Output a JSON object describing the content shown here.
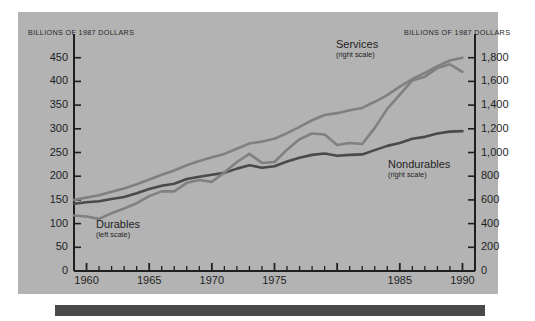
{
  "header": {
    "left_units": "BILLIONS OF 1987 DOLLARS",
    "right_units": "BILLIONS OF 1987 DOLLARS"
  },
  "colors": {
    "panel_background": "#b3b3b3",
    "page_background": "#ffffff",
    "axis": "#1f1f1f",
    "series_dark": "#4a4a4a",
    "series_light": "#808080",
    "footer_bar": "#4a4a4a",
    "text": "#1f1f1f"
  },
  "axes": {
    "left": {
      "ticks": [
        "0",
        "50",
        "100",
        "150",
        "200",
        "250",
        "300",
        "350",
        "400",
        "450"
      ],
      "min": 0,
      "max": 500,
      "label_top": "BILLIONS OF 1987 DOLLARS"
    },
    "right": {
      "ticks": [
        "0",
        "200",
        "400",
        "600",
        "800",
        "1,000",
        "1,200",
        "1,400",
        "1,600",
        "1,800"
      ],
      "min": 0,
      "max": 2000,
      "label_top": "BILLIONS OF 1987 DOLLARS"
    },
    "x": {
      "ticks": [
        "1960",
        "1965",
        "1970",
        "1975",
        "1985",
        "1990"
      ],
      "all_ticks": [
        "1960",
        "1965",
        "1970",
        "1975",
        "1980",
        "1985",
        "1990"
      ],
      "min": 1959,
      "max": 1991
    }
  },
  "series_labels": [
    {
      "name": "Services",
      "scale": "(right scale)"
    },
    {
      "name": "Nondurables",
      "scale": "(right scale)"
    },
    {
      "name": "Durables",
      "scale": "(left scale)"
    }
  ],
  "chart_data": {
    "type": "line",
    "title": "",
    "subtitle": "",
    "xlabel": "",
    "ylabel": "BILLIONS OF 1987 DOLLARS",
    "y2label": "BILLIONS OF 1987 DOLLARS",
    "ylim": [
      0,
      500
    ],
    "y2lim": [
      0,
      2000
    ],
    "xlim": [
      1959,
      1991
    ],
    "grid": false,
    "legend": "inline-annotations",
    "x": [
      1959,
      1960,
      1961,
      1962,
      1963,
      1964,
      1965,
      1966,
      1967,
      1968,
      1969,
      1970,
      1971,
      1972,
      1973,
      1974,
      1975,
      1976,
      1977,
      1978,
      1979,
      1980,
      1981,
      1982,
      1983,
      1984,
      1985,
      1986,
      1987,
      1988,
      1989,
      1990
    ],
    "series": [
      {
        "name": "Services",
        "scale": "right",
        "units": "Billions of 1987 dollars",
        "color": "#808080",
        "values": [
          600,
          620,
          640,
          668,
          696,
          732,
          772,
          812,
          848,
          892,
          928,
          960,
          988,
          1032,
          1076,
          1092,
          1116,
          1164,
          1216,
          1272,
          1316,
          1332,
          1356,
          1376,
          1428,
          1484,
          1556,
          1620,
          1672,
          1728,
          1776,
          1800
        ]
      },
      {
        "name": "Nondurables",
        "scale": "right",
        "units": "Billions of 1987 dollars",
        "color": "#4a4a4a",
        "values": [
          568,
          580,
          588,
          608,
          624,
          656,
          692,
          720,
          736,
          776,
          796,
          812,
          828,
          864,
          892,
          872,
          884,
          924,
          956,
          980,
          992,
          972,
          980,
          984,
          1020,
          1056,
          1080,
          1116,
          1132,
          1160,
          1176,
          1180
        ]
      },
      {
        "name": "Durables",
        "scale": "left",
        "units": "Billions of 1987 dollars",
        "color": "#808080",
        "values": [
          117,
          115,
          110,
          122,
          132,
          143,
          158,
          168,
          168,
          186,
          192,
          188,
          208,
          230,
          247,
          228,
          230,
          256,
          278,
          290,
          288,
          266,
          270,
          268,
          302,
          342,
          372,
          402,
          410,
          428,
          436,
          420
        ]
      }
    ],
    "annotations": [
      {
        "text": "Services",
        "sub": "(right scale)",
        "x": 1986,
        "series": "Services"
      },
      {
        "text": "Nondurables",
        "sub": "(right scale)",
        "x": 1987,
        "series": "Nondurables"
      },
      {
        "text": "Durables",
        "sub": "(left scale)",
        "x": 1962,
        "series": "Durables"
      }
    ]
  }
}
